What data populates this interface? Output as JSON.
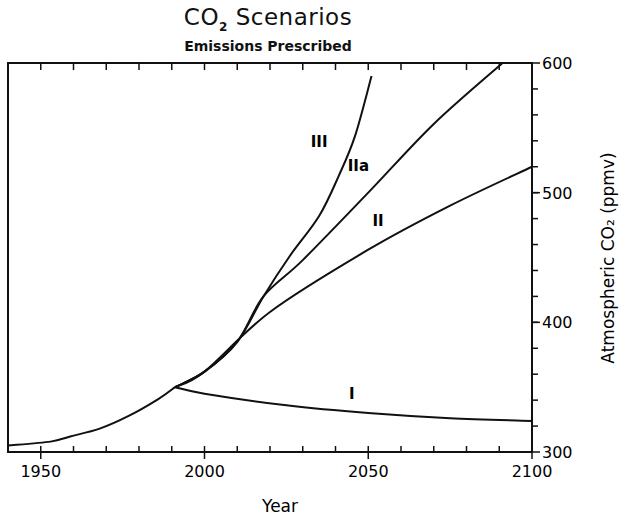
{
  "chart_data": {
    "type": "line",
    "title": "CO2 Scenarios",
    "title_main_prefix": "CO",
    "title_main_sub": "2",
    "title_main_suffix": " Scenarios",
    "subtitle": "Emissions Prescribed",
    "xlabel": "Year",
    "ylabel": "Atmospheric CO₂ (ppmv)",
    "xlim": [
      1940,
      2100
    ],
    "ylim": [
      300,
      600
    ],
    "x_ticks": [
      1950,
      2000,
      2050,
      2100
    ],
    "y_ticks": [
      300,
      400,
      500,
      600
    ],
    "x_minor_step": 10,
    "y_minor_step": 20,
    "y_axis_position": "right",
    "grid": false,
    "legend": "inline labels",
    "series": [
      {
        "name": "Historical",
        "label": "",
        "x": [
          1940,
          1953,
          1959,
          1968,
          1977,
          1986,
          1991
        ],
        "values": [
          305,
          308,
          312,
          318,
          328,
          341,
          350
        ]
      },
      {
        "name": "III",
        "label": "III",
        "label_pos": [
          2035,
          535
        ],
        "x": [
          1991,
          2000,
          2010,
          2018,
          2026,
          2035,
          2041,
          2046,
          2051
        ],
        "values": [
          350,
          362,
          385,
          420,
          451,
          482,
          513,
          544,
          590
        ]
      },
      {
        "name": "IIa",
        "label": "IIa",
        "label_pos": [
          2047,
          517
        ],
        "x": [
          1991,
          2000,
          2010,
          2018,
          2030,
          2050,
          2070,
          2091
        ],
        "values": [
          350,
          362,
          385,
          420,
          448,
          500,
          553,
          600
        ]
      },
      {
        "name": "II",
        "label": "II",
        "label_pos": [
          2053,
          474
        ],
        "x": [
          1991,
          2000,
          2020,
          2050,
          2075,
          2100
        ],
        "values": [
          350,
          362,
          408,
          456,
          490,
          520
        ]
      },
      {
        "name": "I",
        "label": "I",
        "label_pos": [
          2045,
          341
        ],
        "x": [
          1991,
          2000,
          2025,
          2050,
          2075,
          2100
        ],
        "values": [
          350,
          345,
          336,
          330,
          326,
          324
        ]
      }
    ]
  }
}
